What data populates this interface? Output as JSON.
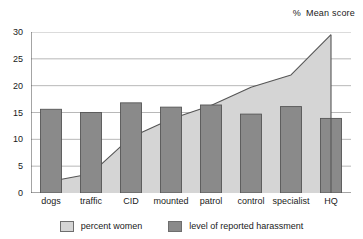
{
  "header": {
    "percent_symbol": "%",
    "title": "Mean score"
  },
  "legend": {
    "items": [
      {
        "label": "percent women",
        "color": "#d5d5d5",
        "name": "legend-percent-women"
      },
      {
        "label": "level of reported harassment",
        "color": "#8a8a8a",
        "name": "legend-harassment"
      }
    ]
  },
  "axis": {
    "y_ticks": [
      "0",
      "5",
      "10",
      "15",
      "20",
      "25",
      "30"
    ],
    "x_ticks": [
      "dogs",
      "traffic",
      "CID",
      "mounted",
      "patrol",
      "control",
      "specialist",
      "HQ"
    ]
  },
  "chart_data": {
    "type": "bar",
    "title": "Mean score",
    "xlabel": "",
    "ylabel": "%",
    "ylim": [
      0,
      30
    ],
    "ytick_step": 5,
    "grid": true,
    "legend_position": "bottom",
    "categories": [
      "dogs",
      "traffic",
      "CID",
      "mounted",
      "patrol",
      "control",
      "specialist",
      "HQ"
    ],
    "series": [
      {
        "name": "percent women",
        "type": "area",
        "color": "#d5d5d5",
        "values": [
          2.2,
          3.6,
          10.4,
          13.8,
          16.3,
          19.7,
          22.0,
          29.5
        ]
      },
      {
        "name": "level of reported harassment",
        "type": "bar",
        "color": "#8a8a8a",
        "values": [
          15.6,
          15.0,
          16.8,
          16.0,
          16.4,
          14.7,
          16.1,
          13.9
        ]
      }
    ]
  }
}
